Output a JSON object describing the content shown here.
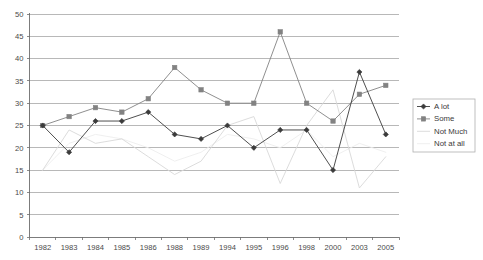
{
  "chart_data": {
    "type": "line",
    "title": "",
    "xlabel": "",
    "ylabel": "",
    "ylim": [
      0,
      50
    ],
    "ytick_step": 5,
    "grid": true,
    "legend_position": "right",
    "categories": [
      "1982",
      "1983",
      "1984",
      "1985",
      "1986",
      "1988",
      "1989",
      "1994",
      "1995",
      "1996",
      "1998",
      "2000",
      "2003",
      "2005"
    ],
    "ytick_labels": [
      "0",
      "5",
      "10",
      "15",
      "20",
      "25",
      "30",
      "35",
      "40",
      "45",
      "50"
    ],
    "series": [
      {
        "name": "A lot",
        "color": "#3b3b3b",
        "marker": "diamond",
        "values": [
          25,
          19,
          26,
          26,
          28,
          23,
          22,
          25,
          20,
          24,
          24,
          15,
          37,
          23
        ]
      },
      {
        "name": "Some",
        "color": "#828282",
        "marker": "square",
        "values": [
          25,
          27,
          29,
          28,
          31,
          38,
          33,
          30,
          30,
          46,
          30,
          26,
          32,
          34
        ]
      },
      {
        "name": "Not Much",
        "color": "#d8d8d8",
        "marker": "none",
        "values": [
          15,
          24,
          21,
          22,
          18,
          14,
          17,
          25,
          27,
          12,
          25,
          33,
          11,
          18
        ]
      },
      {
        "name": "Not at all",
        "color": "#ededed",
        "marker": "none",
        "values": [
          15,
          21,
          23,
          22,
          20,
          17,
          19,
          23,
          22,
          20,
          24,
          18,
          21,
          19
        ]
      }
    ]
  },
  "legend": {
    "entries": [
      {
        "label": "A lot"
      },
      {
        "label": "Some"
      },
      {
        "label": "Not Much"
      },
      {
        "label": "Not at all"
      }
    ]
  }
}
